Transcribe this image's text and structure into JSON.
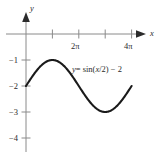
{
  "chart_data": {
    "type": "line",
    "title": "",
    "equation_label": "y = sin(x/2) − 2",
    "xlabel": "x",
    "ylabel": "y",
    "xlim": [
      -0.6,
      14.5
    ],
    "ylim": [
      -4.6,
      0.6
    ],
    "grid": false,
    "legend": "none",
    "x_ticks": [
      {
        "value": 3.141592653589793,
        "label": ""
      },
      {
        "value": 6.283185307179586,
        "label": "2π"
      },
      {
        "value": 9.42477796076938,
        "label": ""
      },
      {
        "value": 12.566370614359172,
        "label": "4π"
      }
    ],
    "y_ticks": [
      {
        "value": -1,
        "label": "−1"
      },
      {
        "value": -2,
        "label": "−2"
      },
      {
        "value": -3,
        "label": "−3"
      },
      {
        "value": -4,
        "label": "−4"
      }
    ],
    "series": [
      {
        "name": "y = sin(x/2) − 2",
        "function": "sin(x/2) - 2",
        "amplitude": 1,
        "period": 12.566370614359172,
        "vertical_shift": -2,
        "x_start": 0,
        "x_end": 12.566370614359172,
        "key_points": [
          {
            "x": 0,
            "y": -2,
            "note": "start on y-axis"
          },
          {
            "x": 3.141592653589793,
            "y": -1,
            "note": "maximum"
          },
          {
            "x": 6.283185307179586,
            "y": -2,
            "note": "midline crossing"
          },
          {
            "x": 9.42477796076938,
            "y": -3,
            "note": "minimum"
          },
          {
            "x": 12.566370614359172,
            "y": -2,
            "note": "end on midline"
          }
        ]
      }
    ],
    "axes": {
      "x_axis_arrow": true,
      "y_axis_arrow": true,
      "x_axis_value": 0,
      "y_axis_value": 0
    }
  },
  "labels": {
    "y_axis_name": "y",
    "x_axis_name": "x",
    "x_tick_2pi": "2π",
    "x_tick_4pi": "4π",
    "y_tick_m1": "−1",
    "y_tick_m2": "−2",
    "y_tick_m3": "−3",
    "y_tick_m4": "−4",
    "equation_y": "y",
    "equation_eq": "= sin(",
    "equation_x": "x",
    "equation_tail": "/2) − 2"
  },
  "colors": {
    "background": "#ffffff",
    "axis": "#8a8a8a",
    "curve": "#1a1a1a",
    "text": "#2b2b2b"
  }
}
